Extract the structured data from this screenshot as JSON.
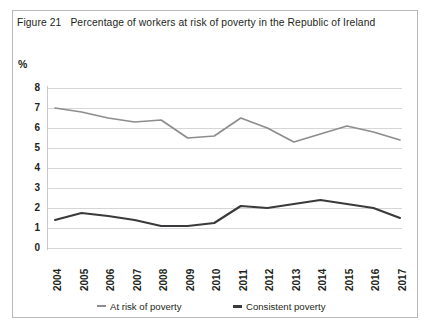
{
  "figure": {
    "number": "Figure 21",
    "title": "Percentage of workers at risk of poverty in the Republic of Ireland",
    "unit_label": "%"
  },
  "colors": {
    "at_risk_line": "#8d8d8f",
    "consistent_line": "#3a3a3c",
    "gridline": "#d6d6d8",
    "border": "#b9b9bb",
    "text": "#231f20",
    "background": "#ffffff"
  },
  "chart_data": {
    "type": "line",
    "title": "Percentage of workers at risk of poverty in the Republic of Ireland",
    "xlabel": "",
    "ylabel": "%",
    "ylim": [
      0,
      8
    ],
    "ytick_labels": [
      "8",
      "7",
      "6",
      "5",
      "4",
      "3",
      "2",
      "1",
      "0"
    ],
    "yticks": [
      8,
      7,
      6,
      5,
      4,
      3,
      2,
      1,
      0
    ],
    "grid": true,
    "legend_position": "bottom",
    "categories": [
      "2004",
      "2005",
      "2006",
      "2007",
      "2008",
      "2009",
      "2010",
      "2011",
      "2012",
      "2013",
      "2014",
      "2015",
      "2016",
      "2017"
    ],
    "series": [
      {
        "name": "At risk of poverty",
        "color": "#8d8d8f",
        "values": [
          7.0,
          6.8,
          6.5,
          6.3,
          6.4,
          5.5,
          5.6,
          6.5,
          6.0,
          5.3,
          5.7,
          6.1,
          5.8,
          5.4
        ]
      },
      {
        "name": "Consistent poverty",
        "color": "#3a3a3c",
        "values": [
          1.4,
          1.75,
          1.6,
          1.4,
          1.1,
          1.1,
          1.25,
          2.1,
          2.0,
          2.2,
          2.4,
          2.2,
          2.0,
          1.5
        ]
      }
    ]
  }
}
